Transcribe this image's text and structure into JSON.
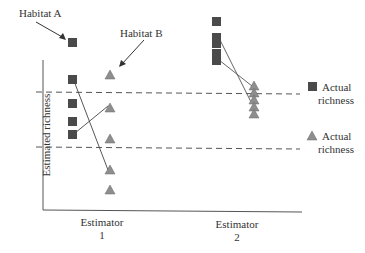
{
  "diagram": {
    "title": "",
    "y_axis_label": "Estimated richness",
    "callouts": {
      "habitat_a": "Habitat A",
      "habitat_b": "Habitat B"
    },
    "x_categories": [
      {
        "line1": "Estimator",
        "line2": "1"
      },
      {
        "line1": "Estimator",
        "line2": "2"
      }
    ],
    "legend": [
      {
        "marker": "square",
        "line1": "Actual",
        "line2": "richness",
        "color": "#4a4a4a"
      },
      {
        "marker": "triangle",
        "line1": "Actual",
        "line2": "richness",
        "color": "#8a8a8a"
      }
    ],
    "reference_lines": [
      {
        "name": "actual-richness-habitat-a",
        "style": "dashed"
      },
      {
        "name": "actual-richness-habitat-b",
        "style": "dashed"
      }
    ],
    "colors": {
      "habitat_a": "#4a4a4a",
      "habitat_b": "#8e8e8e",
      "axis": "#555555"
    }
  }
}
